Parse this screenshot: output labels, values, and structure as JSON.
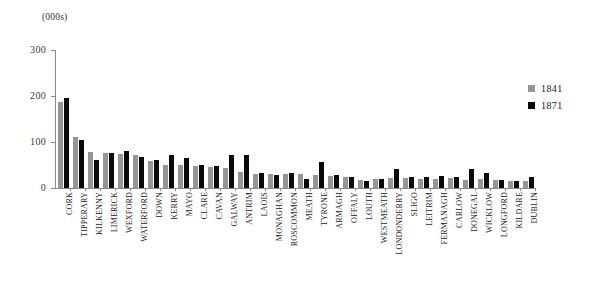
{
  "unit_label": "(000s)",
  "legend": {
    "position": "right",
    "entries": [
      {
        "label": "1841",
        "color": "#969696"
      },
      {
        "label": "1871",
        "color": "#0a0a0a"
      }
    ]
  },
  "chart_data": {
    "type": "bar",
    "title": "",
    "subtitle": "",
    "xlabel": "",
    "ylabel": "(000s)",
    "ylim": [
      0,
      300
    ],
    "yticks": [
      0,
      100,
      200,
      300
    ],
    "grid": false,
    "legend_position": "right",
    "categories": [
      "CORK",
      "TIPPERARY",
      "KILKENNY",
      "LIMERICK",
      "WEXFORD",
      "WATERFORD",
      "DOWN",
      "KERRY",
      "MAYO",
      "CLARE",
      "CAVAN",
      "GALWAY",
      "ANTRIM",
      "LAOIS",
      "MONAGHAN",
      "ROSCOMMON",
      "MEATH",
      "TYRONE",
      "ARMAGH",
      "OFFALY",
      "LOUTH",
      "WESTMEATH",
      "LONDONDERRY",
      "SLIGO",
      "LEITRIM",
      "FERMANAGH",
      "CARLOW",
      "DONEGAL",
      "WICKLOW",
      "LONGFORD",
      "KILDARE",
      "DUBLIN"
    ],
    "series": [
      {
        "name": "1841",
        "color": "#969696",
        "values": [
          187,
          110,
          78,
          76,
          74,
          72,
          58,
          51,
          51,
          48,
          46,
          44,
          34,
          31,
          30,
          31,
          31,
          29,
          26,
          23,
          17,
          20,
          21,
          21,
          20,
          20,
          21,
          18,
          19,
          17,
          15,
          15
        ]
      },
      {
        "name": "1871",
        "color": "#0a0a0a",
        "values": [
          195,
          105,
          60,
          76,
          80,
          67,
          61,
          72,
          65,
          50,
          48,
          72,
          71,
          32,
          29,
          33,
          19,
          56,
          28,
          23,
          15,
          20,
          42,
          24,
          25,
          27,
          23,
          42,
          32,
          18,
          16,
          25
        ]
      }
    ]
  }
}
